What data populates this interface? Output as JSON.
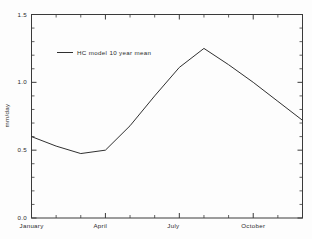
{
  "chart_data": {
    "type": "line",
    "title": "",
    "xlabel": "",
    "ylabel": "mm/day",
    "ylim": [
      0.0,
      1.5
    ],
    "grid": false,
    "legend_position": "upper-left-inside",
    "ytick_labels": [
      "0.0",
      "0.5",
      "1.0",
      "1.5"
    ],
    "ytick_values": [
      0.0,
      0.5,
      1.0,
      1.5
    ],
    "yminor_step": 0.1,
    "xtick_labels": [
      "January",
      "April",
      "July",
      "October"
    ],
    "xtick_values": [
      1,
      4,
      7,
      10
    ],
    "categories": [
      "January",
      "February",
      "March",
      "April",
      "May",
      "June",
      "July",
      "August",
      "September",
      "October",
      "November",
      "December"
    ],
    "series": [
      {
        "name": "HC model 10 year mean",
        "color": "#303030",
        "values": [
          0.6,
          0.53,
          0.475,
          0.5,
          0.68,
          0.9,
          1.11,
          1.25,
          1.13,
          1.0,
          0.86,
          0.72
        ]
      }
    ]
  },
  "legend": {
    "entries": [
      {
        "label": "HC model 10 year mean"
      }
    ]
  },
  "axes": {
    "y_axis_label": "mm/day"
  }
}
